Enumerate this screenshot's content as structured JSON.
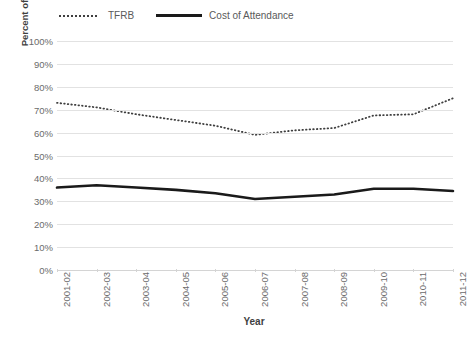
{
  "legend": {
    "position": "top-left",
    "entries": [
      {
        "label": "TFRB",
        "style": "dotted",
        "color": "#3f3f3f",
        "icon": "dotted-line-icon"
      },
      {
        "label": "Cost of Attendance",
        "style": "solid",
        "color": "#1a1a1a",
        "icon": "solid-line-icon"
      }
    ]
  },
  "chart_data": {
    "type": "line",
    "title": "",
    "xlabel": "Year",
    "ylabel": "Percent of Price Covered by Pell Grant Maximum",
    "categories": [
      "2001-02",
      "2002-03",
      "2003-04",
      "2004-05",
      "2005-06",
      "2006-07",
      "2007-08",
      "2008-09",
      "2009-10",
      "2010-11",
      "2011-12"
    ],
    "ylim": [
      0,
      100
    ],
    "ytick_labels": [
      "0%",
      "10%",
      "20%",
      "30%",
      "40%",
      "50%",
      "60%",
      "70%",
      "80%",
      "90%",
      "100%"
    ],
    "ytick_values": [
      0,
      10,
      20,
      30,
      40,
      50,
      60,
      70,
      80,
      90,
      100
    ],
    "ytick_step": 10,
    "grid": true,
    "grid_axis": "y",
    "legend_position": "top-left",
    "series": [
      {
        "name": "TFRB",
        "style": "dotted",
        "color": "#3f3f3f",
        "values": [
          73,
          71,
          68,
          65.5,
          63,
          59,
          61,
          62,
          67.5,
          68,
          75
        ]
      },
      {
        "name": "Cost of Attendance",
        "style": "solid",
        "color": "#1a1a1a",
        "values": [
          36,
          37,
          36,
          35,
          33.5,
          31,
          32,
          33,
          35.5,
          35.5,
          34.5
        ]
      }
    ]
  }
}
